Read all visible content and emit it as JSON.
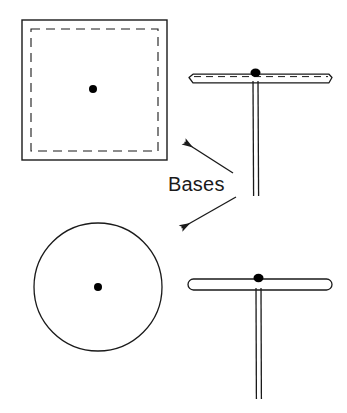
{
  "figure": {
    "kind": "line-drawing",
    "background_color": "#ffffff",
    "stroke_color": "#1a1a1a",
    "fill_color": "#ffffff",
    "dot_color": "#000000",
    "annotation": {
      "label": "Bases",
      "x": 168,
      "y": 191,
      "font_size": 20
    },
    "arrows": [
      {
        "name": "arrow-to-square-base",
        "direction": "up-left",
        "from_x": 233,
        "from_y": 173,
        "to_x": 183,
        "to_y": 141
      },
      {
        "name": "arrow-to-round-base",
        "direction": "down-left",
        "from_x": 236,
        "from_y": 197,
        "to_x": 180,
        "to_y": 229
      }
    ],
    "parts": [
      {
        "name": "square-base-plan",
        "shape": "square",
        "view": "plan",
        "x": 22,
        "y": 20,
        "width": 145,
        "height": 140,
        "inner_dashed_inset": 9,
        "center_dot_x": 93,
        "center_dot_y": 89,
        "center_dot_radius": 4
      },
      {
        "name": "square-base-elevation",
        "shape": "flat-plate-with-post",
        "view": "side",
        "plate_x": 188,
        "plate_y": 74,
        "plate_width": 144,
        "plate_height": 9,
        "plate_end_style": "tapered",
        "plate_has_dashed_line": true,
        "post_center_x": 255,
        "post_top_y": 83,
        "post_bottom_y": 196,
        "post_width": 5,
        "knob_x": 255,
        "knob_y": 73,
        "knob_radius": 4
      },
      {
        "name": "round-base-plan",
        "shape": "circle",
        "view": "plan",
        "center_x": 98,
        "center_y": 287,
        "radius": 64,
        "center_dot_x": 98,
        "center_dot_y": 287,
        "center_dot_radius": 4
      },
      {
        "name": "round-base-elevation",
        "shape": "rounded-disc-with-post",
        "view": "side",
        "plate_x": 188,
        "plate_y": 279,
        "plate_width": 144,
        "plate_height": 11,
        "plate_end_style": "rounded",
        "plate_has_dashed_line": false,
        "post_center_x": 258,
        "post_top_y": 290,
        "post_bottom_y": 399,
        "post_width": 5,
        "knob_x": 258,
        "knob_y": 278,
        "knob_radius": 4
      }
    ]
  }
}
